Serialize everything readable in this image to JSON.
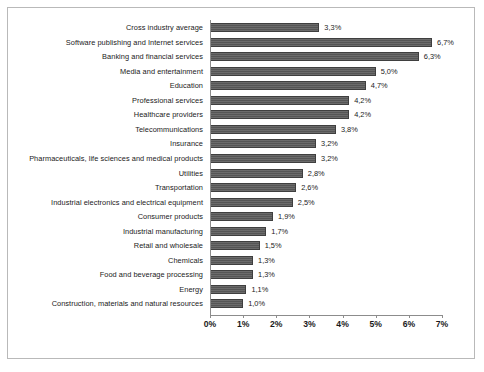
{
  "chart_data": {
    "type": "bar",
    "orientation": "horizontal",
    "title": "",
    "subtitle": "",
    "xlabel": "",
    "ylabel": "",
    "xlim": [
      0,
      7
    ],
    "xtick_labels": [
      "0%",
      "1%",
      "2%",
      "3%",
      "4%",
      "5%",
      "6%",
      "7%"
    ],
    "xtick_values": [
      0,
      1,
      2,
      3,
      4,
      5,
      6,
      7
    ],
    "grid": false,
    "legend": false,
    "value_label_format": "comma-decimal-percent",
    "bar_color": "#5a5a5a",
    "bar_border_color": "#3f3f3f",
    "categories": [
      "Cross industry average",
      "Software publishing and Internet services",
      "Banking and financial services",
      "Media and entertainment",
      "Education",
      "Professional services",
      "Healthcare providers",
      "Telecommunications",
      "Insurance",
      "Pharmaceuticals, life sciences and medical products",
      "Utilities",
      "Transportation",
      "Industrial electronics and electrical equipment",
      "Consumer products",
      "Industrial manufacturing",
      "Retail and wholesale",
      "Chemicals",
      "Food and beverage processing",
      "Energy",
      "Construction, materials and natural resources"
    ],
    "values": [
      3.3,
      6.7,
      6.3,
      5.0,
      4.7,
      4.2,
      4.2,
      3.8,
      3.2,
      3.2,
      2.8,
      2.6,
      2.5,
      1.9,
      1.7,
      1.5,
      1.3,
      1.3,
      1.1,
      1.0
    ],
    "value_labels": [
      "3,3%",
      "6,7%",
      "6,3%",
      "5,0%",
      "4,7%",
      "4,2%",
      "4,2%",
      "3,8%",
      "3,2%",
      "3,2%",
      "2,8%",
      "2,6%",
      "2,5%",
      "1,9%",
      "1,7%",
      "1,5%",
      "1,3%",
      "1,3%",
      "1,1%",
      "1,0%"
    ]
  }
}
